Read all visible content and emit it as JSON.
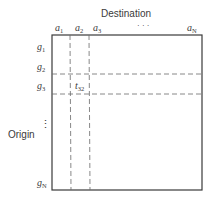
{
  "diagram": {
    "title_top": "Destination",
    "title_left": "Origin",
    "columns": [
      {
        "base": "a",
        "sub": "1"
      },
      {
        "base": "a",
        "sub": "2"
      },
      {
        "base": "a",
        "sub": "3"
      },
      {
        "base": "· · ·",
        "sub": ""
      },
      {
        "base": "a",
        "sub": "N"
      }
    ],
    "rows": [
      {
        "base": "g",
        "sub": "1"
      },
      {
        "base": "g",
        "sub": "2"
      },
      {
        "base": "g",
        "sub": "3"
      },
      {
        "base": "⋮",
        "sub": ""
      },
      {
        "base": "g",
        "sub": "N"
      }
    ],
    "cell_label": {
      "base": "t",
      "sub": "32"
    },
    "colors": {
      "line": "#3a3a3a",
      "dash": "#6a6a6a",
      "background": "#ffffff"
    }
  }
}
